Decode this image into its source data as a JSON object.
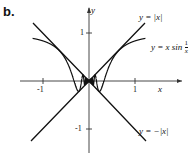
{
  "panel_label": "b.",
  "axes": {
    "x_label": "x",
    "y_label": "y",
    "x_ticks": [
      "-1",
      "1"
    ],
    "y_ticks": [
      "1",
      "-1"
    ]
  },
  "curves": [
    {
      "name": "abs",
      "label": "y = |x|"
    },
    {
      "name": "xsin",
      "label_main": "y = x sin",
      "label_frac_num": "1",
      "label_frac_den": "x"
    },
    {
      "name": "negabs",
      "label": "y = −|x|"
    }
  ],
  "colors": {
    "ink": "#111111",
    "axis": "#333333",
    "background": "#ffffff"
  }
}
